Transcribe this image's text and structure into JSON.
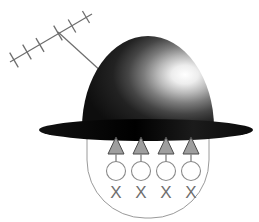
{
  "figure": {
    "background_color": "#ffffff",
    "width": 259,
    "height": 222
  },
  "antenna": {
    "name": "yagi-antenna",
    "boom": {
      "x1": 10,
      "y1": 62,
      "x2": 92,
      "y2": 14,
      "color": "#6d6d6d",
      "width": 1.2
    },
    "junction": {
      "x": 58,
      "y": 32
    },
    "mast": {
      "x1": 58,
      "y1": 32,
      "x2": 103,
      "y2": 73,
      "color": "#6d6d6d",
      "width": 1.2
    },
    "element_color": "#6d6d6d",
    "element_width": 1.3,
    "elements": [
      {
        "cx": 14,
        "cy": 60,
        "len": 17
      },
      {
        "cx": 27,
        "cy": 52,
        "len": 17
      },
      {
        "cx": 40,
        "cy": 45,
        "len": 16
      },
      {
        "cx": 58,
        "cy": 33,
        "len": 17
      },
      {
        "cx": 72,
        "cy": 26,
        "len": 15
      },
      {
        "cx": 86,
        "cy": 17,
        "len": 14
      }
    ]
  },
  "hat": {
    "name": "bowler-hat",
    "crown": {
      "cx": 148,
      "cy": 128,
      "rx": 66,
      "ry": 92,
      "dark_color": "#141414",
      "mid_color": "#3a3a3a",
      "highlight_color": "#f2f2f2",
      "highlight_offset_x": 0.78,
      "highlight_offset_y": 0.42
    },
    "brim": {
      "cx": 146,
      "cy": 130,
      "rx": 107,
      "ry": 11,
      "color": "#0d0d0d"
    }
  },
  "head": {
    "name": "head-outline",
    "outline_color": "#9a9a9a",
    "outline_width": 1,
    "left_x": 87,
    "right_x": 209,
    "top_y": 131,
    "bottom_y": 218,
    "corner_radius": 58
  },
  "arrows": {
    "name": "upward-arrows",
    "count": 4,
    "fill_color": "#9e9e9e",
    "stroke_color": "#4a4a4a",
    "stem_color": "#8a8a8a",
    "xs": [
      116,
      141,
      166,
      191
    ],
    "tip_y": 137,
    "base_y": 154,
    "half_width": 8,
    "stem_bottom_y": 162
  },
  "circles": {
    "name": "open-circles",
    "count": 4,
    "stroke_color": "#8a8a8a",
    "fill_color": "none",
    "radius": 9.5,
    "cy": 171,
    "xs": [
      116,
      141,
      166,
      191
    ]
  },
  "x_marks": {
    "name": "x-marks",
    "count": 4,
    "label": "X",
    "color": "#6f6f6f",
    "font_size": 17,
    "cy": 194,
    "xs": [
      116,
      141,
      166,
      191
    ],
    "labels": [
      "X",
      "X",
      "X",
      "X"
    ]
  }
}
